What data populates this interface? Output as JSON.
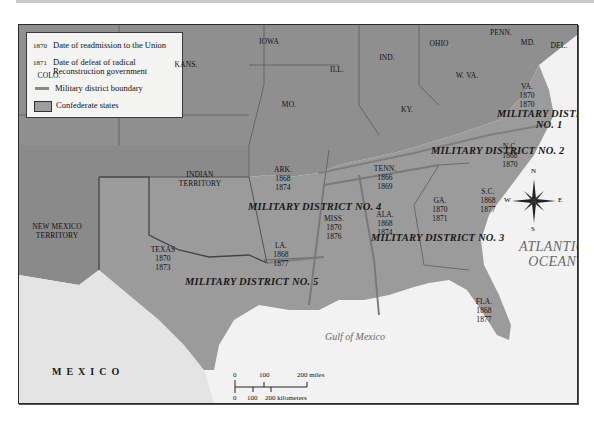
{
  "legend": {
    "items": [
      {
        "symbol": "1870",
        "label": "Date of readmission to the Union"
      },
      {
        "symbol": "1871",
        "label": "Date of defeat of radical Reconstruction government"
      },
      {
        "symbol": "line",
        "label": "Military district boundary"
      },
      {
        "symbol": "box",
        "label": "Confederate states"
      }
    ]
  },
  "colors": {
    "confederate": "#9a9a9a",
    "union_territory": "#8c8c8c",
    "water": "#f3f3f3",
    "mexico": "#e2e2e2",
    "district_boundary": "#8a8a8a",
    "frame": "#2b2b2b"
  },
  "non_confederate_labels": [
    {
      "name": "IOWA"
    },
    {
      "name": "ILL."
    },
    {
      "name": "IND."
    },
    {
      "name": "OHIO"
    },
    {
      "name": "PENN."
    },
    {
      "name": "MD."
    },
    {
      "name": "DEL."
    },
    {
      "name": "W. VA."
    },
    {
      "name": "KY."
    },
    {
      "name": "MO."
    },
    {
      "name": "KANS."
    },
    {
      "name": "COLO."
    },
    {
      "name": "INDIAN TERRITORY"
    },
    {
      "name": "NEW MEXICO TERRITORY"
    }
  ],
  "confederate_states": [
    {
      "name": "VA.",
      "readmission": "1870",
      "defeat": "1870"
    },
    {
      "name": "N.C.",
      "readmission": "1868",
      "defeat": "1870"
    },
    {
      "name": "TENN.",
      "readmission": "1866",
      "defeat": "1869"
    },
    {
      "name": "S.C.",
      "readmission": "1868",
      "defeat": "1877"
    },
    {
      "name": "ARK.",
      "readmission": "1868",
      "defeat": "1874"
    },
    {
      "name": "GA.",
      "readmission": "1870",
      "defeat": "1871"
    },
    {
      "name": "ALA.",
      "readmission": "1868",
      "defeat": "1874"
    },
    {
      "name": "MISS.",
      "readmission": "1870",
      "defeat": "1876"
    },
    {
      "name": "LA.",
      "readmission": "1868",
      "defeat": "1877"
    },
    {
      "name": "TEXAS",
      "readmission": "1870",
      "defeat": "1873"
    },
    {
      "name": "FLA.",
      "readmission": "1868",
      "defeat": "1877"
    }
  ],
  "military_districts": [
    {
      "label": "MILITARY DISTRICT NO. 1",
      "line1": "MILITARY DISTRICT",
      "line2": "NO. 1"
    },
    {
      "label": "MILITARY DISTRICT NO. 2"
    },
    {
      "label": "MILITARY DISTRICT NO. 3"
    },
    {
      "label": "MILITARY DISTRICT NO. 4"
    },
    {
      "label": "MILITARY DISTRICT NO. 5"
    }
  ],
  "water": {
    "atlantic_line1": "ATLANTIC",
    "atlantic_line2": "OCEAN",
    "gulf": "Gulf of Mexico"
  },
  "countries": {
    "mexico": "MEXICO"
  },
  "compass": {
    "n": "N",
    "s": "S",
    "e": "E",
    "w": "W"
  },
  "scale": {
    "miles_0": "0",
    "miles_100": "100",
    "miles_200": "200 miles",
    "km_0": "0",
    "km_100": "100",
    "km_200": "200 kilometers"
  }
}
